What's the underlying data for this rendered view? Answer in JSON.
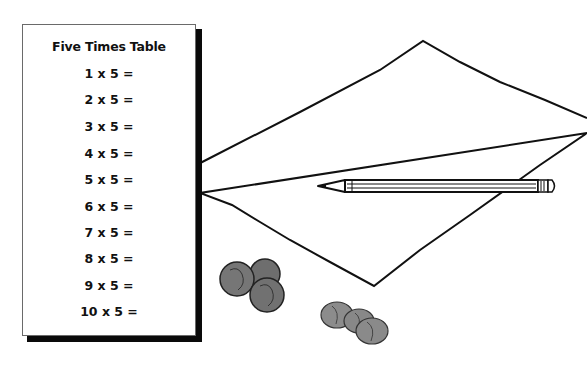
{
  "worksheet": {
    "title": "Five Times Table",
    "rows": [
      "1 x 5 =",
      "2 x 5 =",
      "3 x 5 =",
      "4 x 5 =",
      "5 x 5 =",
      "6 x 5 =",
      "7 x 5 =",
      "8 x 5 =",
      "9 x 5 =",
      "10 x 5 ="
    ]
  },
  "illustration": {
    "objects": [
      "paper-sheet",
      "pencil",
      "nickels",
      "pennies"
    ]
  },
  "colors": {
    "ink": "#111111",
    "coin_gray": "#7a7a7a",
    "card_shadow": "#0a0a0a"
  }
}
